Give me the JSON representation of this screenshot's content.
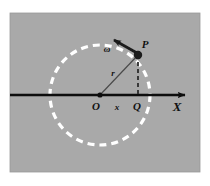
{
  "figure": {
    "background_color": "#ffffff",
    "panel_color": "#a9a9a9",
    "panel": {
      "x": 10,
      "y": 13,
      "width": 190,
      "height": 159
    },
    "axis_color": "#111111",
    "circle_color": "#ffffff",
    "dash_color": "#333333",
    "radius_line_color": "#555555"
  },
  "circle": {
    "label": "dashed-trajectory-circle",
    "center_x": 100,
    "center_y": 95,
    "radius": 50,
    "stroke": "#ffffff",
    "stroke_width": 3.2,
    "dash_pattern": "7 5"
  },
  "axis": {
    "label": "X",
    "name": "x-axis",
    "start_x": 10,
    "end_x": 188,
    "y": 95,
    "stroke_width": 2.4,
    "label_x": 176,
    "label_y": 110
  },
  "points": {
    "origin": {
      "label": "O",
      "x": 100,
      "y": 95,
      "label_x": 96,
      "label_y": 110,
      "dot_radius": 2.6
    },
    "particle": {
      "label": "P",
      "x": 138,
      "y": 55,
      "label_x": 145,
      "label_y": 48,
      "dot_radius": 4.2
    },
    "projection": {
      "label": "Q",
      "x": 138,
      "y": 95,
      "label_x": 134,
      "label_y": 110,
      "dot_radius": 0
    }
  },
  "segments": {
    "radius": {
      "label": "r",
      "from_x": 100,
      "from_y": 95,
      "to_x": 138,
      "to_y": 55,
      "label_x": 112,
      "label_y": 74,
      "stroke_width": 1.2
    },
    "projection_drop": {
      "label": "dashed-drop-line",
      "from_x": 138,
      "from_y": 55,
      "to_x": 138,
      "to_y": 95,
      "dash_pattern": "4 3",
      "stroke_width": 1.8
    },
    "displacement": {
      "label": "x",
      "from_x": 100,
      "from_y": 95,
      "to_x": 138,
      "to_y": 95,
      "label_x": 117,
      "label_y": 110
    }
  },
  "angular_velocity": {
    "label": "ω",
    "name": "omega-vector",
    "from_x": 137,
    "from_y": 53,
    "to_x": 113,
    "to_y": 40,
    "label_x": 108,
    "label_y": 51,
    "stroke_width": 2.6,
    "description": "tangential velocity arrow at P pointing counter-clockwise"
  },
  "legend_text": {
    "omega": "ω",
    "radius": "r",
    "displacement": "x",
    "point_p": "P",
    "point_q": "Q",
    "point_o": "O",
    "axis": "X"
  }
}
